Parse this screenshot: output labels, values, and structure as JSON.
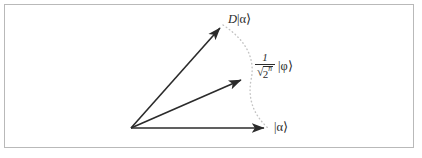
{
  "figure": {
    "type": "vector-diagram",
    "background_color": "#ffffff",
    "frame": {
      "border_color": "#b9b9b9",
      "x": 4,
      "y": 4,
      "width": 410,
      "height": 144
    },
    "origin": {
      "x": 131,
      "y": 128
    },
    "stroke_color": "#2b2b2b",
    "dotted_color": "#c0c0c0",
    "vectors": [
      {
        "name": "displaced-state-vector",
        "label": "D |α⟩",
        "label_parts": {
          "operator": "D",
          "ket": "|α⟩"
        },
        "tip": {
          "x": 223,
          "y": 25
        },
        "style": "solid-arrow"
      },
      {
        "name": "normalized-phi-vector",
        "label": "1/√(2ⁿ) |φ⟩",
        "label_parts": {
          "numerator": "1",
          "radicand": "2",
          "exponent": "n",
          "ket": "|φ⟩"
        },
        "tip": {
          "x": 245,
          "y": 78
        },
        "style": "solid-arrow"
      },
      {
        "name": "alpha-state-vector",
        "label": "|α⟩",
        "label_parts": {
          "ket": "|α⟩"
        },
        "tip": {
          "x": 268,
          "y": 128
        },
        "style": "solid-arrow"
      }
    ],
    "arc": {
      "name": "dotted-arc",
      "style": "dotted",
      "from": {
        "x": 223,
        "y": 25
      },
      "through": {
        "x": 251,
        "y": 78
      },
      "to": {
        "x": 268,
        "y": 128
      }
    }
  },
  "labels": {
    "d_alpha": {
      "operator": "D",
      "ket": "|α⟩"
    },
    "phi": {
      "numerator": "1",
      "radical_sign": "√",
      "radicand": "2",
      "exponent": "n",
      "ket": "|φ⟩"
    },
    "alpha": {
      "ket": "|α⟩"
    }
  }
}
